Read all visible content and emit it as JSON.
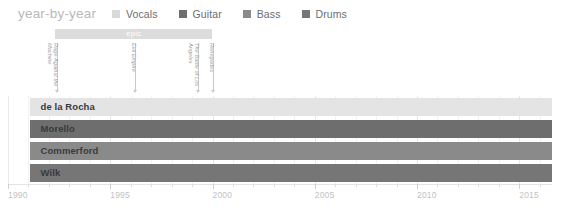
{
  "header": {
    "title": "year-by-year"
  },
  "legend": {
    "items": [
      {
        "label": "Vocals",
        "color": "#d9d9d9"
      },
      {
        "label": "Guitar",
        "color": "#6e6e6e"
      },
      {
        "label": "Bass",
        "color": "#8a8a8a"
      },
      {
        "label": "Drums",
        "color": "#767676"
      }
    ]
  },
  "eras": [
    {
      "label": "epic",
      "start": 1992.3,
      "end": 2000.0,
      "color": "#dcdcdc"
    }
  ],
  "annotations": [
    {
      "label": "Rage Against the\nMachine",
      "year": 1992.4
    },
    {
      "label": "Evil Empire",
      "year": 1996.2
    },
    {
      "label": "The Battle of Los\nAngeles",
      "year": 1999.3
    },
    {
      "label": "Renegades",
      "year": 2000.0
    }
  ],
  "chart_data": {
    "type": "bar",
    "title": "year-by-year",
    "xlabel": "",
    "ylabel": "",
    "xlim": [
      1990,
      2016.6
    ],
    "grid": true,
    "legend_position": "top",
    "categories": [
      "de la Rocha",
      "Morello",
      "Commerford",
      "Wilk"
    ],
    "series": [
      {
        "name": "Vocals",
        "member": "de la Rocha",
        "color": "#e4e4e4",
        "start": 1991.1,
        "end": 2016.6
      },
      {
        "name": "Guitar",
        "member": "Morello",
        "color": "#6e6e6e",
        "start": 1991.1,
        "end": 2016.6
      },
      {
        "name": "Bass",
        "member": "Commerford",
        "color": "#8a8a8a",
        "start": 1991.1,
        "end": 2016.6
      },
      {
        "name": "Drums",
        "member": "Wilk",
        "color": "#767676",
        "start": 1991.1,
        "end": 2016.6
      }
    ]
  },
  "axis": {
    "major_ticks": [
      1990,
      1995,
      2000,
      2005,
      2010,
      2015
    ],
    "major_labels": [
      "1990",
      "1995",
      "2000",
      "2005",
      "2010",
      "2015"
    ],
    "minor_step": 1,
    "min": 1990,
    "max": 2016.6
  },
  "geometry": {
    "x0_px": 8,
    "px_per_year": 20.45,
    "row_tops": [
      2,
      24,
      46,
      68
    ],
    "row_height": 18
  }
}
